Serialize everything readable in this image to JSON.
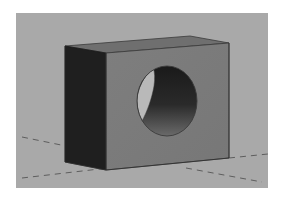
{
  "viewport": {
    "label": "3D model viewport",
    "background_color": "#a9a9a9"
  },
  "model": {
    "name": "rectangular block with through hole",
    "colors": {
      "side_face": "#202020",
      "front_face": "#7b7b7b",
      "top_face": "#6e6e6e",
      "edge": "#3a3a3a",
      "hole_inner_dark": "#1c1c1c",
      "hole_inner_mid": "#505050",
      "hole_exit_light": "#b8b8b8"
    }
  },
  "ground_plane": {
    "style": "dashed",
    "line_color": "#555555"
  }
}
